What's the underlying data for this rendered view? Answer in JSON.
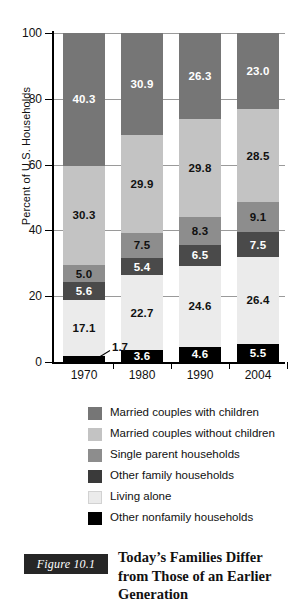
{
  "chart_data": {
    "type": "bar",
    "subtype": "stacked-bar-100",
    "title": "",
    "xlabel": "",
    "ylabel": "Percent of U.S. Households",
    "categories": [
      "1970",
      "1980",
      "1990",
      "2004"
    ],
    "ylim": [
      0,
      100
    ],
    "yticks": [
      0,
      20,
      40,
      60,
      80,
      100
    ],
    "ytick_labels": [
      "0",
      "20",
      "40",
      "60",
      "80",
      "100"
    ],
    "grid": true,
    "legend_position": "below-plot",
    "stack_order_bottom_to_top": [
      "Other nonfamily households",
      "Living alone",
      "Other family households",
      "Single parent households",
      "Married couples without children",
      "Married couples with children"
    ],
    "series": [
      {
        "name": "Married couples with children",
        "color": "#767676",
        "label_color": "#ffffff",
        "values": [
          40.3,
          30.9,
          26.3,
          23.0
        ]
      },
      {
        "name": "Married couples without children",
        "color": "#c3c3c3",
        "label_color": "#111111",
        "values": [
          30.3,
          29.9,
          29.8,
          28.5
        ]
      },
      {
        "name": "Single parent households",
        "color": "#8d8d8d",
        "label_color": "#111111",
        "values": [
          5.0,
          7.5,
          8.3,
          9.1
        ]
      },
      {
        "name": "Other family households",
        "color": "#4a4a4a",
        "label_color": "#ffffff",
        "values": [
          5.6,
          5.4,
          6.5,
          7.5
        ]
      },
      {
        "name": "Living alone",
        "color": "#ebebeb",
        "label_color": "#111111",
        "values": [
          17.1,
          22.7,
          24.6,
          26.4
        ]
      },
      {
        "name": "Other nonfamily households",
        "color": "#000000",
        "label_color": "#ffffff",
        "values": [
          1.7,
          3.6,
          4.6,
          5.5
        ]
      }
    ],
    "annotations": [
      {
        "text": "1.7",
        "describes": "Other nonfamily households 1970",
        "leader_line": true
      }
    ]
  },
  "legend": {
    "items": [
      {
        "label": "Married couples with children",
        "color": "#767676"
      },
      {
        "label": "Married couples without children",
        "color": "#c3c3c3"
      },
      {
        "label": "Single parent households",
        "color": "#8d8d8d"
      },
      {
        "label": "Other family households",
        "color": "#3a3a3a"
      },
      {
        "label": "Living alone",
        "color": "#ebebeb"
      },
      {
        "label": "Other nonfamily households",
        "color": "#000000"
      }
    ]
  },
  "caption": {
    "figure_number": "Figure 10.1",
    "title": "Today’s Families Differ from Those of an Earlier Generation",
    "badge_color": "#262626"
  }
}
